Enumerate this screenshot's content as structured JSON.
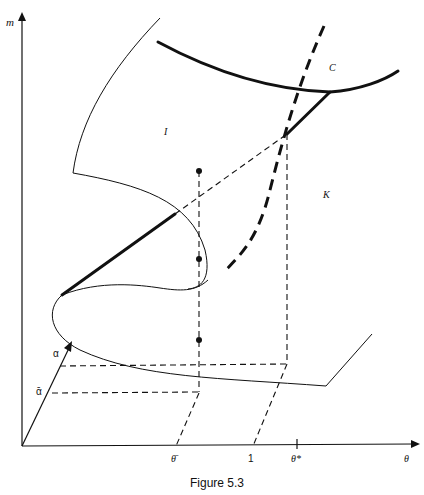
{
  "figure": {
    "caption": "Figure 5.3",
    "axes": {
      "vertical_label": "m",
      "horizontal_label": "θ",
      "depth_label_upper": "α",
      "depth_label_lower": "ᾱ"
    },
    "horizontal_ticks": [
      {
        "label": "θ̄"
      },
      {
        "label": "1"
      },
      {
        "label": "θ*"
      }
    ],
    "region_labels": {
      "C": "C",
      "I": "I",
      "K": "K"
    },
    "points": 3
  },
  "colors": {
    "ink": "#111111",
    "background": "#ffffff"
  }
}
